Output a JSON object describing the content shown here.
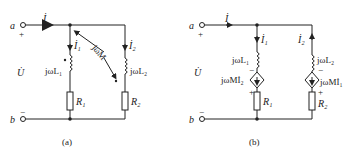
{
  "panel_a": {
    "caption": "(a)",
    "terminal_a": "a",
    "terminal_b": "b",
    "plus": "+",
    "minus": "−",
    "current_total": "İ",
    "current_1": "İ₁",
    "current_2": "İ₂",
    "voltage": "U̇",
    "inductor_1": "jωL₁",
    "inductor_2": "jωL₂",
    "mutual": "jωM",
    "resistor_1": "R₁",
    "resistor_2": "R₂"
  },
  "panel_b": {
    "caption": "(b)",
    "terminal_a": "a",
    "terminal_b": "b",
    "plus": "+",
    "minus": "−",
    "current_total": "İ",
    "current_1": "İ₁",
    "current_2": "İ₂",
    "voltage": "U̇",
    "inductor_1": "jωL₁",
    "inductor_2": "jωL₂",
    "source_1": "jωMİ₂",
    "source_2": "jωMİ₁",
    "resistor_1": "R₁",
    "resistor_2": "R₂"
  }
}
